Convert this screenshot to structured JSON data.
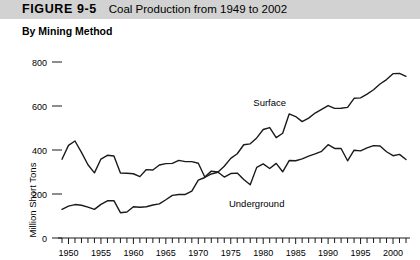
{
  "header": {
    "figure_number": "FIGURE 9-5",
    "title": "Coal Production from 1949 to 2002",
    "band_color": "#d2d2d2"
  },
  "subtitle": "By Mining Method",
  "chart_data": {
    "type": "line",
    "title": "Coal Production from 1949 to 2002",
    "subtitle": "By Mining Method",
    "xlabel": "",
    "ylabel": "Million Short Tons",
    "xlim": [
      1949,
      2002
    ],
    "ylim": [
      0,
      800
    ],
    "yticks": [
      0,
      200,
      400,
      600,
      800
    ],
    "ytick_labels": [
      "0",
      "200",
      "400",
      "600",
      "800"
    ],
    "xticks": [
      1950,
      1955,
      1960,
      1965,
      1970,
      1975,
      1980,
      1985,
      1990,
      1995,
      2000
    ],
    "xtick_labels": [
      "1950",
      "1955",
      "1960",
      "1965",
      "1970",
      "1975",
      "1980",
      "1985",
      "1990",
      "1995",
      "2000"
    ],
    "minor_xtick_interval": 1,
    "grid": false,
    "legend": "inline-labels",
    "x": [
      1949,
      1950,
      1951,
      1952,
      1953,
      1954,
      1955,
      1956,
      1957,
      1958,
      1959,
      1960,
      1961,
      1962,
      1963,
      1964,
      1965,
      1966,
      1967,
      1968,
      1969,
      1970,
      1971,
      1972,
      1973,
      1974,
      1975,
      1976,
      1977,
      1978,
      1979,
      1980,
      1981,
      1982,
      1983,
      1984,
      1985,
      1986,
      1987,
      1988,
      1989,
      1990,
      1991,
      1992,
      1993,
      1994,
      1995,
      1996,
      1997,
      1998,
      1999,
      2000,
      2001,
      2002
    ],
    "series": [
      {
        "name": "Underground",
        "color": "#1a1a1a",
        "label_x": 1979,
        "label_y": 150,
        "values": [
          358,
          421,
          441,
          389,
          333,
          296,
          359,
          376,
          373,
          295,
          294,
          292,
          279,
          311,
          309,
          332,
          338,
          339,
          353,
          347,
          347,
          340,
          277,
          304,
          300,
          277,
          293,
          295,
          266,
          242,
          321,
          337,
          316,
          339,
          301,
          352,
          351,
          360,
          372,
          382,
          394,
          424,
          407,
          407,
          351,
          399,
          396,
          410,
          420,
          418,
          392,
          374,
          380,
          357
        ]
      },
      {
        "name": "Surface",
        "color": "#1a1a1a",
        "label_x": 1981,
        "label_y": 560,
        "values": [
          130,
          145,
          152,
          149,
          140,
          130,
          153,
          169,
          170,
          115,
          118,
          142,
          140,
          142,
          150,
          155,
          174,
          194,
          198,
          198,
          213,
          263,
          275,
          291,
          299,
          326,
          362,
          383,
          424,
          428,
          455,
          493,
          502,
          456,
          476,
          564,
          552,
          529,
          545,
          568,
          585,
          602,
          589,
          590,
          594,
          635,
          637,
          654,
          674,
          700,
          720,
          747,
          748,
          735
        ]
      }
    ],
    "annotations": [
      {
        "text": "Surface",
        "x": 1981,
        "y": 600
      },
      {
        "text": "Underground",
        "x": 1979,
        "y": 140
      }
    ]
  },
  "axis": {
    "y_title": "Million Short Tons"
  }
}
